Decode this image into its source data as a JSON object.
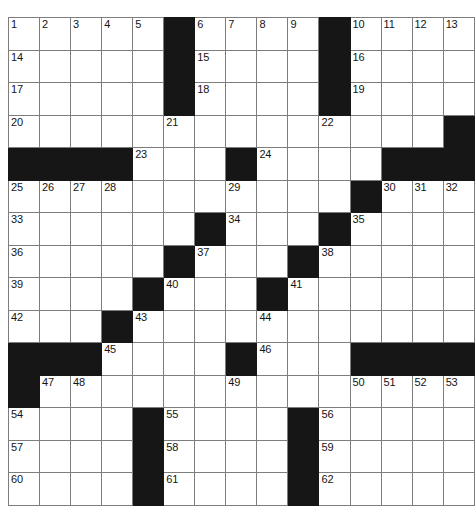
{
  "puzzle": {
    "title": "",
    "rows": 15,
    "cols": 15,
    "colors": {
      "block": "#161616",
      "cell": "#ffffff",
      "grid_line": "#7d7d7d",
      "number_text": "#141414"
    },
    "grid": [
      [
        {
          "type": "cell",
          "number": "1"
        },
        {
          "type": "cell",
          "number": "2"
        },
        {
          "type": "cell",
          "number": "3"
        },
        {
          "type": "cell",
          "number": "4"
        },
        {
          "type": "cell",
          "number": "5"
        },
        {
          "type": "block",
          "number": ""
        },
        {
          "type": "cell",
          "number": "6"
        },
        {
          "type": "cell",
          "number": "7"
        },
        {
          "type": "cell",
          "number": "8"
        },
        {
          "type": "cell",
          "number": "9"
        },
        {
          "type": "block",
          "number": ""
        },
        {
          "type": "cell",
          "number": "10"
        },
        {
          "type": "cell",
          "number": "11"
        },
        {
          "type": "cell",
          "number": "12"
        },
        {
          "type": "cell",
          "number": "13"
        }
      ],
      [
        {
          "type": "cell",
          "number": "14"
        },
        {
          "type": "cell",
          "number": ""
        },
        {
          "type": "cell",
          "number": ""
        },
        {
          "type": "cell",
          "number": ""
        },
        {
          "type": "cell",
          "number": ""
        },
        {
          "type": "block",
          "number": ""
        },
        {
          "type": "cell",
          "number": "15"
        },
        {
          "type": "cell",
          "number": ""
        },
        {
          "type": "cell",
          "number": ""
        },
        {
          "type": "cell",
          "number": ""
        },
        {
          "type": "block",
          "number": ""
        },
        {
          "type": "cell",
          "number": "16"
        },
        {
          "type": "cell",
          "number": ""
        },
        {
          "type": "cell",
          "number": ""
        },
        {
          "type": "cell",
          "number": ""
        }
      ],
      [
        {
          "type": "cell",
          "number": "17"
        },
        {
          "type": "cell",
          "number": ""
        },
        {
          "type": "cell",
          "number": ""
        },
        {
          "type": "cell",
          "number": ""
        },
        {
          "type": "cell",
          "number": ""
        },
        {
          "type": "block",
          "number": ""
        },
        {
          "type": "cell",
          "number": "18"
        },
        {
          "type": "cell",
          "number": ""
        },
        {
          "type": "cell",
          "number": ""
        },
        {
          "type": "cell",
          "number": ""
        },
        {
          "type": "block",
          "number": ""
        },
        {
          "type": "cell",
          "number": "19"
        },
        {
          "type": "cell",
          "number": ""
        },
        {
          "type": "cell",
          "number": ""
        },
        {
          "type": "cell",
          "number": ""
        }
      ],
      [
        {
          "type": "cell",
          "number": "20"
        },
        {
          "type": "cell",
          "number": ""
        },
        {
          "type": "cell",
          "number": ""
        },
        {
          "type": "cell",
          "number": ""
        },
        {
          "type": "cell",
          "number": ""
        },
        {
          "type": "cell",
          "number": "21"
        },
        {
          "type": "cell",
          "number": ""
        },
        {
          "type": "cell",
          "number": ""
        },
        {
          "type": "cell",
          "number": ""
        },
        {
          "type": "cell",
          "number": ""
        },
        {
          "type": "cell",
          "number": "22"
        },
        {
          "type": "cell",
          "number": ""
        },
        {
          "type": "cell",
          "number": ""
        },
        {
          "type": "cell",
          "number": ""
        },
        {
          "type": "block",
          "number": ""
        }
      ],
      [
        {
          "type": "block",
          "number": ""
        },
        {
          "type": "block",
          "number": ""
        },
        {
          "type": "block",
          "number": ""
        },
        {
          "type": "block",
          "number": ""
        },
        {
          "type": "cell",
          "number": "23"
        },
        {
          "type": "cell",
          "number": ""
        },
        {
          "type": "cell",
          "number": ""
        },
        {
          "type": "block",
          "number": ""
        },
        {
          "type": "cell",
          "number": "24"
        },
        {
          "type": "cell",
          "number": ""
        },
        {
          "type": "cell",
          "number": ""
        },
        {
          "type": "cell",
          "number": ""
        },
        {
          "type": "block",
          "number": ""
        },
        {
          "type": "block",
          "number": ""
        },
        {
          "type": "block",
          "number": ""
        }
      ],
      [
        {
          "type": "cell",
          "number": "25"
        },
        {
          "type": "cell",
          "number": "26"
        },
        {
          "type": "cell",
          "number": "27"
        },
        {
          "type": "cell",
          "number": "28"
        },
        {
          "type": "cell",
          "number": ""
        },
        {
          "type": "cell",
          "number": ""
        },
        {
          "type": "cell",
          "number": ""
        },
        {
          "type": "cell",
          "number": "29"
        },
        {
          "type": "cell",
          "number": ""
        },
        {
          "type": "cell",
          "number": ""
        },
        {
          "type": "cell",
          "number": ""
        },
        {
          "type": "block",
          "number": ""
        },
        {
          "type": "cell",
          "number": "30"
        },
        {
          "type": "cell",
          "number": "31"
        },
        {
          "type": "cell",
          "number": "32"
        }
      ],
      [
        {
          "type": "cell",
          "number": "33"
        },
        {
          "type": "cell",
          "number": ""
        },
        {
          "type": "cell",
          "number": ""
        },
        {
          "type": "cell",
          "number": ""
        },
        {
          "type": "cell",
          "number": ""
        },
        {
          "type": "cell",
          "number": ""
        },
        {
          "type": "block",
          "number": ""
        },
        {
          "type": "cell",
          "number": "34"
        },
        {
          "type": "cell",
          "number": ""
        },
        {
          "type": "cell",
          "number": ""
        },
        {
          "type": "block",
          "number": ""
        },
        {
          "type": "cell",
          "number": "35"
        },
        {
          "type": "cell",
          "number": ""
        },
        {
          "type": "cell",
          "number": ""
        },
        {
          "type": "cell",
          "number": ""
        }
      ],
      [
        {
          "type": "cell",
          "number": "36"
        },
        {
          "type": "cell",
          "number": ""
        },
        {
          "type": "cell",
          "number": ""
        },
        {
          "type": "cell",
          "number": ""
        },
        {
          "type": "cell",
          "number": ""
        },
        {
          "type": "block",
          "number": ""
        },
        {
          "type": "cell",
          "number": "37"
        },
        {
          "type": "cell",
          "number": ""
        },
        {
          "type": "cell",
          "number": ""
        },
        {
          "type": "block",
          "number": ""
        },
        {
          "type": "cell",
          "number": "38"
        },
        {
          "type": "cell",
          "number": ""
        },
        {
          "type": "cell",
          "number": ""
        },
        {
          "type": "cell",
          "number": ""
        },
        {
          "type": "cell",
          "number": ""
        }
      ],
      [
        {
          "type": "cell",
          "number": "39"
        },
        {
          "type": "cell",
          "number": ""
        },
        {
          "type": "cell",
          "number": ""
        },
        {
          "type": "cell",
          "number": ""
        },
        {
          "type": "block",
          "number": ""
        },
        {
          "type": "cell",
          "number": "40"
        },
        {
          "type": "cell",
          "number": ""
        },
        {
          "type": "cell",
          "number": ""
        },
        {
          "type": "block",
          "number": ""
        },
        {
          "type": "cell",
          "number": "41"
        },
        {
          "type": "cell",
          "number": ""
        },
        {
          "type": "cell",
          "number": ""
        },
        {
          "type": "cell",
          "number": ""
        },
        {
          "type": "cell",
          "number": ""
        },
        {
          "type": "cell",
          "number": ""
        }
      ],
      [
        {
          "type": "cell",
          "number": "42"
        },
        {
          "type": "cell",
          "number": ""
        },
        {
          "type": "cell",
          "number": ""
        },
        {
          "type": "block",
          "number": ""
        },
        {
          "type": "cell",
          "number": "43"
        },
        {
          "type": "cell",
          "number": ""
        },
        {
          "type": "cell",
          "number": ""
        },
        {
          "type": "cell",
          "number": ""
        },
        {
          "type": "cell",
          "number": "44"
        },
        {
          "type": "cell",
          "number": ""
        },
        {
          "type": "cell",
          "number": ""
        },
        {
          "type": "cell",
          "number": ""
        },
        {
          "type": "cell",
          "number": ""
        },
        {
          "type": "cell",
          "number": ""
        },
        {
          "type": "cell",
          "number": ""
        }
      ],
      [
        {
          "type": "block",
          "number": ""
        },
        {
          "type": "block",
          "number": ""
        },
        {
          "type": "block",
          "number": ""
        },
        {
          "type": "cell",
          "number": "45"
        },
        {
          "type": "cell",
          "number": ""
        },
        {
          "type": "cell",
          "number": ""
        },
        {
          "type": "cell",
          "number": ""
        },
        {
          "type": "block",
          "number": ""
        },
        {
          "type": "cell",
          "number": "46"
        },
        {
          "type": "cell",
          "number": ""
        },
        {
          "type": "cell",
          "number": ""
        },
        {
          "type": "block",
          "number": ""
        },
        {
          "type": "block",
          "number": ""
        },
        {
          "type": "block",
          "number": ""
        },
        {
          "type": "block",
          "number": ""
        }
      ],
      [
        {
          "type": "block",
          "number": ""
        },
        {
          "type": "cell",
          "number": "47"
        },
        {
          "type": "cell",
          "number": "48"
        },
        {
          "type": "cell",
          "number": ""
        },
        {
          "type": "cell",
          "number": ""
        },
        {
          "type": "cell",
          "number": ""
        },
        {
          "type": "cell",
          "number": ""
        },
        {
          "type": "cell",
          "number": "49"
        },
        {
          "type": "cell",
          "number": ""
        },
        {
          "type": "cell",
          "number": ""
        },
        {
          "type": "cell",
          "number": ""
        },
        {
          "type": "cell",
          "number": "50"
        },
        {
          "type": "cell",
          "number": "51"
        },
        {
          "type": "cell",
          "number": "52"
        },
        {
          "type": "cell",
          "number": "53"
        }
      ],
      [
        {
          "type": "cell",
          "number": "54"
        },
        {
          "type": "cell",
          "number": ""
        },
        {
          "type": "cell",
          "number": ""
        },
        {
          "type": "cell",
          "number": ""
        },
        {
          "type": "block",
          "number": ""
        },
        {
          "type": "cell",
          "number": "55"
        },
        {
          "type": "cell",
          "number": ""
        },
        {
          "type": "cell",
          "number": ""
        },
        {
          "type": "cell",
          "number": ""
        },
        {
          "type": "block",
          "number": ""
        },
        {
          "type": "cell",
          "number": "56"
        },
        {
          "type": "cell",
          "number": ""
        },
        {
          "type": "cell",
          "number": ""
        },
        {
          "type": "cell",
          "number": ""
        },
        {
          "type": "cell",
          "number": ""
        }
      ],
      [
        {
          "type": "cell",
          "number": "57"
        },
        {
          "type": "cell",
          "number": ""
        },
        {
          "type": "cell",
          "number": ""
        },
        {
          "type": "cell",
          "number": ""
        },
        {
          "type": "block",
          "number": ""
        },
        {
          "type": "cell",
          "number": "58"
        },
        {
          "type": "cell",
          "number": ""
        },
        {
          "type": "cell",
          "number": ""
        },
        {
          "type": "cell",
          "number": ""
        },
        {
          "type": "block",
          "number": ""
        },
        {
          "type": "cell",
          "number": "59"
        },
        {
          "type": "cell",
          "number": ""
        },
        {
          "type": "cell",
          "number": ""
        },
        {
          "type": "cell",
          "number": ""
        },
        {
          "type": "cell",
          "number": ""
        }
      ],
      [
        {
          "type": "cell",
          "number": "60"
        },
        {
          "type": "cell",
          "number": ""
        },
        {
          "type": "cell",
          "number": ""
        },
        {
          "type": "cell",
          "number": ""
        },
        {
          "type": "block",
          "number": ""
        },
        {
          "type": "cell",
          "number": "61"
        },
        {
          "type": "cell",
          "number": ""
        },
        {
          "type": "cell",
          "number": ""
        },
        {
          "type": "cell",
          "number": ""
        },
        {
          "type": "block",
          "number": ""
        },
        {
          "type": "cell",
          "number": "62"
        },
        {
          "type": "cell",
          "number": ""
        },
        {
          "type": "cell",
          "number": ""
        },
        {
          "type": "cell",
          "number": ""
        },
        {
          "type": "cell",
          "number": ""
        }
      ]
    ]
  }
}
